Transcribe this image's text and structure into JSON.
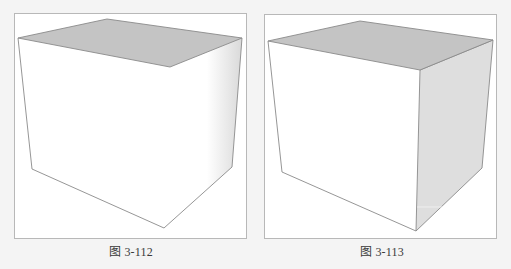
{
  "figures": [
    {
      "caption": "图 3-112",
      "description": "Box with shaded top face; right side face white with soft gradient shading",
      "colors": {
        "top_face": "#c4c4c4",
        "front_face": "#ffffff",
        "side_face": "#ffffff",
        "edge": "#8a8a8a"
      }
    },
    {
      "caption": "图 3-113",
      "description": "Box with shaded top face and shaded right side face",
      "colors": {
        "top_face": "#c4c4c4",
        "front_face": "#ffffff",
        "side_face": "#dedede",
        "edge": "#8a8a8a"
      }
    }
  ]
}
